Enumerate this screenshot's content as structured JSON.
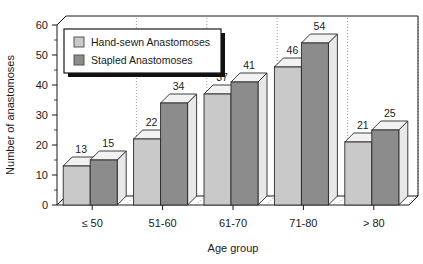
{
  "chart_data": {
    "type": "bar",
    "title": "",
    "xlabel": "Age group",
    "ylabel": "Number of anastomoses",
    "categories": [
      "≤ 50",
      "51-60",
      "61-70",
      "71-80",
      "> 80"
    ],
    "series": [
      {
        "name": "Hand-sewn Anastomoses",
        "values": [
          13,
          22,
          37,
          46,
          21
        ],
        "color": "#c9c9c9"
      },
      {
        "name": "Stapled Anastomoses",
        "values": [
          15,
          34,
          41,
          54,
          25
        ],
        "color": "#8c8c8c"
      }
    ],
    "ylim": [
      0,
      60
    ],
    "yticks": [
      0,
      10,
      20,
      30,
      40,
      50,
      60
    ],
    "ytick_labels": [
      "0",
      "10",
      "20",
      "30",
      "40",
      "50",
      "60"
    ],
    "grid": "vertical-dotted-between-groups",
    "legend_position": "top-left-inside",
    "style": "3d-bars"
  },
  "legend": {
    "items": [
      {
        "label": "Hand-sewn Anastomoses",
        "swatch_color": "#c9c9c9"
      },
      {
        "label": "Stapled Anastomoses",
        "swatch_color": "#8c8c8c"
      }
    ]
  },
  "colors": {
    "light_bar": "#c9c9c9",
    "dark_bar": "#8c8c8c",
    "bar_top": "#f2f2f2",
    "outline": "#2b2b2b",
    "grid": "#9a9a9a",
    "text": "#1a1a1a",
    "background": "#ffffff"
  }
}
